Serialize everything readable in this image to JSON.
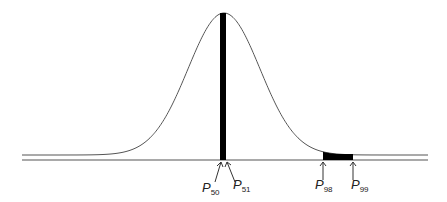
{
  "diagram": {
    "type": "normal-distribution-percentiles",
    "markers": [
      {
        "id": "p50",
        "letter": "P",
        "sub": "50"
      },
      {
        "id": "p51",
        "letter": "P",
        "sub": "51"
      },
      {
        "id": "p98",
        "letter": "P",
        "sub": "98"
      },
      {
        "id": "p99",
        "letter": "P",
        "sub": "99"
      }
    ],
    "shaded_regions": [
      {
        "from": "P50",
        "to": "P51",
        "note": "tall narrow slice at the mean"
      },
      {
        "from": "P98",
        "to": "P99",
        "note": "short wide slice in the right tail"
      }
    ]
  }
}
